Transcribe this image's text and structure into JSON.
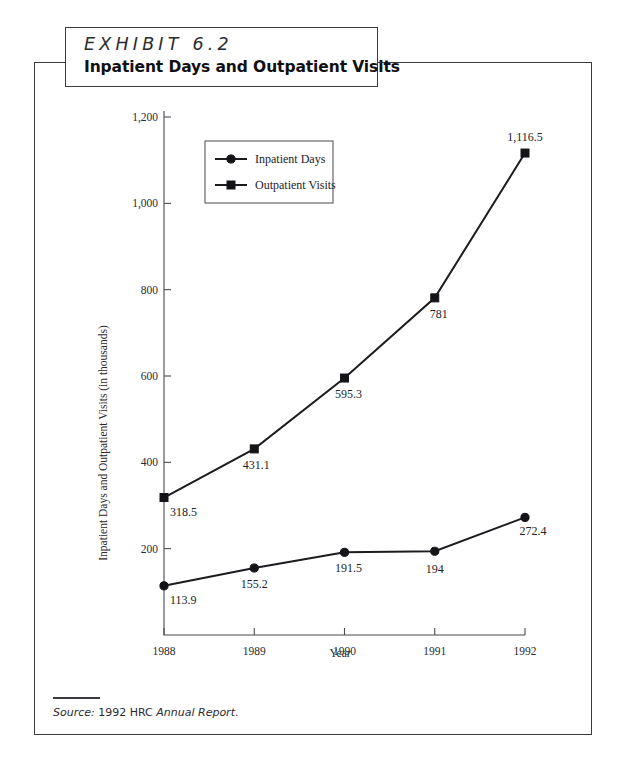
{
  "exhibit": {
    "number_label": "EXHIBIT 6.2",
    "title": "Inpatient Days and Outpatient Visits"
  },
  "source": {
    "label": "Source:",
    "middle": " 1992 HRC ",
    "italic_part": "Annual Report",
    "period": "."
  },
  "legend": {
    "position": "inside-top-left",
    "entries": [
      {
        "label": "Inpatient Days",
        "marker": "circle-marker",
        "color": "#1c1c20"
      },
      {
        "label": "Outpatient Visits",
        "marker": "square-marker",
        "color": "#1c1c20"
      }
    ]
  },
  "chart_data": {
    "type": "line",
    "title": "Inpatient Days and Outpatient Visits",
    "xlabel": "Year",
    "ylabel": "Inpatient Days and Outpatient Visits (in thousands)",
    "categories": [
      "1988",
      "1989",
      "1990",
      "1991",
      "1992"
    ],
    "x": [
      1988,
      1989,
      1990,
      1991,
      1992
    ],
    "xlim": [
      1988,
      1992
    ],
    "ylim": [
      0,
      1200
    ],
    "yticks": [
      200,
      400,
      600,
      800,
      1000,
      1200
    ],
    "ytick_labels": [
      "200",
      "400",
      "600",
      "800",
      "1,000",
      "1,200"
    ],
    "xtick_labels": [
      "1988",
      "1989",
      "1990",
      "1991",
      "1992"
    ],
    "grid": false,
    "legend_position": "upper left inside",
    "series": [
      {
        "name": "Inpatient Days",
        "marker": "circle",
        "color": "#1c1c20",
        "values": [
          113.9,
          155.2,
          191.5,
          194,
          272.4
        ],
        "data_labels": [
          "113.9",
          "155.2",
          "191.5",
          "194",
          "272.4"
        ]
      },
      {
        "name": "Outpatient Visits",
        "marker": "square",
        "color": "#1c1c20",
        "values": [
          318.5,
          431.1,
          595.3,
          781,
          1116.5
        ],
        "data_labels": [
          "318.5",
          "431.1",
          "595.3",
          "781",
          "1,116.5"
        ]
      }
    ]
  }
}
